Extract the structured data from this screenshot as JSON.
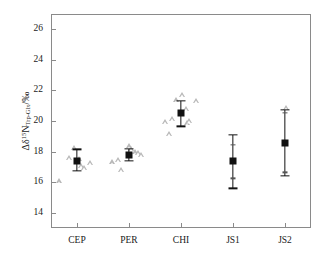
{
  "chart_data": {
    "type": "scatter",
    "title": "",
    "xlabel": "",
    "ylabel_parts": {
      "delta_prefix": "Δδ",
      "superscript": "15",
      "element": "N",
      "subscript": "Trp-Glx",
      "units": "/‰"
    },
    "ylabel": "Δδ15N_Trp-Glx/‰",
    "categories": [
      "CEP",
      "PER",
      "CHI",
      "JS1",
      "JS2"
    ],
    "ylim": [
      13.0,
      27.0
    ],
    "ytick_labels": [
      "14",
      "16",
      "18",
      "20",
      "22",
      "24",
      "26"
    ],
    "yticks": [
      14,
      16,
      18,
      20,
      22,
      24,
      26
    ],
    "grid": false,
    "legend": null,
    "series": [
      {
        "name": "mean with error bars",
        "marker": "filled-square",
        "color": "#111111",
        "values": [
          17.4,
          17.78,
          20.5,
          17.4,
          18.55
        ],
        "err_low": [
          16.75,
          17.4,
          19.65,
          15.6,
          16.4
        ],
        "err_high": [
          18.15,
          18.2,
          21.3,
          19.1,
          20.75
        ],
        "inner_ticks": [
          [],
          [],
          [],
          [
            18.45,
            16.25
          ],
          [
            20.55,
            16.65
          ]
        ]
      },
      {
        "name": "individual measurements",
        "marker": "open-triangle",
        "color": "#b9b9b9",
        "points": [
          {
            "category": "CEP",
            "x_offset": -18.0,
            "y": 16.05
          },
          {
            "category": "CEP",
            "x_offset": -8.5,
            "y": 17.6
          },
          {
            "category": "CEP",
            "x_offset": -3.0,
            "y": 18.25
          },
          {
            "category": "CEP",
            "x_offset": 1.5,
            "y": 17.5
          },
          {
            "category": "CEP",
            "x_offset": 3.5,
            "y": 17.05
          },
          {
            "category": "CEP",
            "x_offset": 6.5,
            "y": 16.95
          },
          {
            "category": "CEP",
            "x_offset": 13.0,
            "y": 17.25
          },
          {
            "category": "PER",
            "x_offset": -17.0,
            "y": 17.3
          },
          {
            "category": "PER",
            "x_offset": -11.0,
            "y": 17.45
          },
          {
            "category": "PER",
            "x_offset": -8.0,
            "y": 16.8
          },
          {
            "category": "PER",
            "x_offset": -0.5,
            "y": 18.35
          },
          {
            "category": "PER",
            "x_offset": 1.5,
            "y": 18.2
          },
          {
            "category": "PER",
            "x_offset": 5.5,
            "y": 17.95
          },
          {
            "category": "PER",
            "x_offset": 9.0,
            "y": 17.9
          },
          {
            "category": "PER",
            "x_offset": 12.0,
            "y": 17.8
          },
          {
            "category": "CHI",
            "x_offset": -16.0,
            "y": 19.95
          },
          {
            "category": "CHI",
            "x_offset": -12.0,
            "y": 19.15
          },
          {
            "category": "CHI",
            "x_offset": -9.5,
            "y": 20.15
          },
          {
            "category": "CHI",
            "x_offset": -5.5,
            "y": 21.35
          },
          {
            "category": "CHI",
            "x_offset": 0.5,
            "y": 21.7
          },
          {
            "category": "CHI",
            "x_offset": 5.0,
            "y": 20.8
          },
          {
            "category": "CHI",
            "x_offset": 5.5,
            "y": 19.85
          },
          {
            "category": "CHI",
            "x_offset": 7.5,
            "y": 20.0
          },
          {
            "category": "CHI",
            "x_offset": 15.0,
            "y": 21.3
          },
          {
            "category": "JS2",
            "x_offset": 1.0,
            "y": 20.85
          }
        ]
      }
    ]
  },
  "axis": {
    "y_tick_labels": [
      "26",
      "24",
      "22",
      "20",
      "18",
      "16",
      "14"
    ],
    "x_tick_labels": [
      "CEP",
      "PER",
      "CHI",
      "JS1",
      "JS2"
    ]
  }
}
